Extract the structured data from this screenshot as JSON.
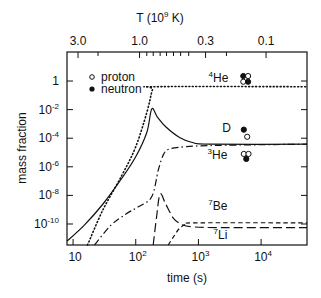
{
  "chart_data": {
    "type": "line",
    "title": "",
    "xlabel": "time (s)",
    "ylabel": "mass fraction",
    "top_axis_label": "T (10",
    "top_axis_label_exp": "9",
    "top_axis_label_tail": " K)",
    "xscale": "log",
    "yscale": "log",
    "xlim": [
      8,
      54000
    ],
    "ylim_log10": [
      -11.47,
      2.03
    ],
    "x_ticks": [
      {
        "value": 10,
        "base": "10",
        "exp": ""
      },
      {
        "value": 100,
        "base": "10",
        "exp": "2"
      },
      {
        "value": 1000,
        "base": "10",
        "exp": "3"
      },
      {
        "value": 10000,
        "base": "10",
        "exp": "4"
      }
    ],
    "y_ticks": [
      {
        "log": 0,
        "base": "1",
        "exp": ""
      },
      {
        "log": -2,
        "base": "10",
        "exp": "-2"
      },
      {
        "log": -4,
        "base": "10",
        "exp": "-4"
      },
      {
        "log": -6,
        "base": "10",
        "exp": "-6"
      },
      {
        "log": -8,
        "base": "10",
        "exp": "-8"
      },
      {
        "log": -10,
        "base": "10",
        "exp": "-10"
      }
    ],
    "top_ticks": [
      {
        "t": 12,
        "label": "3.0"
      },
      {
        "t": 115,
        "label": "1.0"
      },
      {
        "t": 1300,
        "label": "0.3"
      },
      {
        "t": 12000,
        "label": "0.1"
      }
    ],
    "top_minor_ticks_t": [
      25,
      150,
      190,
      245,
      310,
      400,
      520,
      700,
      2800
    ],
    "series": [
      {
        "name": "D",
        "style": "solid",
        "points": [
          [
            8,
            -11.2
          ],
          [
            15,
            -10.1
          ],
          [
            30,
            -8.6
          ],
          [
            60,
            -6.8
          ],
          [
            100,
            -5.3
          ],
          [
            150,
            -3.6
          ],
          [
            180,
            -1.96
          ],
          [
            220,
            -2.5
          ],
          [
            300,
            -3.2
          ],
          [
            500,
            -3.95
          ],
          [
            800,
            -4.3
          ],
          [
            1500,
            -4.42
          ],
          [
            54000,
            -4.42
          ]
        ]
      },
      {
        "name": "4He",
        "style": "dotted",
        "points": [
          [
            17,
            -11.47
          ],
          [
            30,
            -9.0
          ],
          [
            60,
            -6.6
          ],
          [
            100,
            -4.6
          ],
          [
            150,
            -2.2
          ],
          [
            185,
            -0.6
          ],
          [
            210,
            -0.4
          ],
          [
            54000,
            -0.4
          ]
        ]
      },
      {
        "name": "3He",
        "style": "dashdot",
        "points": [
          [
            22,
            -11.47
          ],
          [
            40,
            -10.1
          ],
          [
            70,
            -9.3
          ],
          [
            110,
            -8.8
          ],
          [
            180,
            -8.1
          ],
          [
            230,
            -6.2
          ],
          [
            280,
            -5.1
          ],
          [
            350,
            -4.75
          ],
          [
            600,
            -4.6
          ],
          [
            2000,
            -4.5
          ],
          [
            54000,
            -4.42
          ]
        ]
      },
      {
        "name": "7Be",
        "style": "longdash",
        "points": [
          [
            190,
            -11.47
          ],
          [
            215,
            -9.5
          ],
          [
            245,
            -7.9
          ],
          [
            300,
            -8.6
          ],
          [
            400,
            -9.6
          ],
          [
            550,
            -10.05
          ],
          [
            800,
            -10.2
          ],
          [
            2000,
            -10.25
          ],
          [
            54000,
            -10.25
          ]
        ]
      },
      {
        "name": "7Li",
        "style": "shortdash",
        "points": [
          [
            330,
            -11.47
          ],
          [
            400,
            -10.9
          ],
          [
            500,
            -10.3
          ],
          [
            650,
            -10.0
          ],
          [
            1000,
            -9.92
          ],
          [
            54000,
            -9.92
          ]
        ]
      }
    ],
    "curve_labels": [
      {
        "sup": "4",
        "text": "He",
        "t": 3000,
        "log": -0.05
      },
      {
        "sup": "",
        "text": "D",
        "t": 3300,
        "log": -3.55
      },
      {
        "sup": "3",
        "text": "He",
        "t": 2900,
        "log": -5.45
      },
      {
        "sup": "7",
        "text": "Be",
        "t": 2900,
        "log": -9.0
      },
      {
        "sup": "7",
        "text": "Li",
        "t": 2900,
        "log": -11.05
      }
    ],
    "observations": [
      {
        "species": "4He",
        "points": [
          {
            "t": 5200,
            "log": 0.35,
            "kind": "neutron"
          },
          {
            "t": 6200,
            "log": 0.35,
            "kind": "proton"
          },
          {
            "t": 5200,
            "log": -0.05,
            "kind": "proton"
          },
          {
            "t": 6200,
            "log": -0.05,
            "kind": "neutron"
          }
        ]
      },
      {
        "species": "D",
        "points": [
          {
            "t": 5300,
            "log": -3.4,
            "kind": "neutron"
          },
          {
            "t": 6000,
            "log": -3.9,
            "kind": "proton"
          }
        ]
      },
      {
        "species": "3He",
        "points": [
          {
            "t": 5300,
            "log": -5.1,
            "kind": "proton"
          },
          {
            "t": 6300,
            "log": -5.1,
            "kind": "proton"
          },
          {
            "t": 5800,
            "log": -5.45,
            "kind": "neutron"
          }
        ]
      }
    ],
    "legend": {
      "position": "top-left",
      "entries": [
        {
          "marker": "open-circle",
          "label": "proton"
        },
        {
          "marker": "filled-circle",
          "label": "neutron"
        }
      ]
    },
    "grid": false
  }
}
